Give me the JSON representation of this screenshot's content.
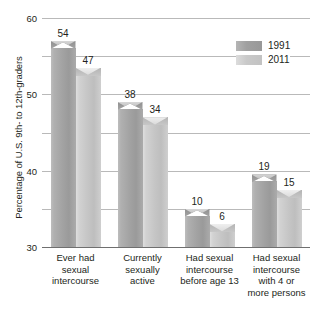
{
  "chart_data": {
    "type": "bar",
    "title": "",
    "xlabel": "",
    "ylabel": "Percentage of U.S. 9th- to 12th-graders",
    "ylim": [
      0,
      60
    ],
    "yticks": [
      0,
      10,
      20,
      30,
      40,
      50,
      60
    ],
    "grid": true,
    "legend_position": "top-right",
    "categories": [
      "Ever had sexual intercourse",
      "Currently sexually active",
      "Had sexual intercourse before age 13",
      "Had sexual intercourse with 4 or more persons"
    ],
    "category_lines": [
      [
        "Ever had",
        "sexual",
        "intercourse"
      ],
      [
        "Currently",
        "sexually",
        "active"
      ],
      [
        "Had sexual",
        "intercourse",
        "before age 13"
      ],
      [
        "Had sexual",
        "intercourse",
        "with 4 or",
        "more persons"
      ]
    ],
    "series": [
      {
        "name": "1991",
        "color": "#a0a0a0",
        "values": [
          54,
          38,
          10,
          19
        ]
      },
      {
        "name": "2011",
        "color": "#c8c8c8",
        "values": [
          47,
          34,
          6,
          15
        ]
      }
    ]
  },
  "axis": {
    "y_title": "Percentage of U.S. 9th- to 12th-graders",
    "tick_labels": [
      "0",
      "10",
      "20",
      "30",
      "40",
      "50",
      "60"
    ]
  },
  "legend": {
    "items": [
      {
        "label": "1991"
      },
      {
        "label": "2011"
      }
    ]
  }
}
